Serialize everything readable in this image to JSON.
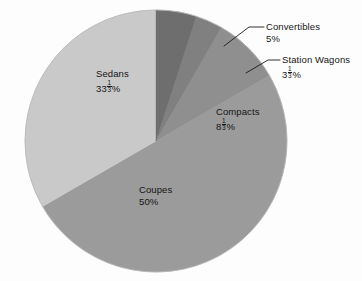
{
  "figure": {
    "background_color": "#fdfdfd",
    "width": 362,
    "height": 281
  },
  "chart_data": {
    "type": "pie",
    "title": "",
    "subtitle": "",
    "xlabel": "",
    "ylabel": "",
    "legend_position": "none",
    "grid": false,
    "label_style": "slice-labels-with-leader-lines",
    "start_angle_deg": 0,
    "direction": "clockwise",
    "center": {
      "x": 156,
      "y": 141
    },
    "radius": 131,
    "categories": [
      "Convertibles",
      "Station Wagons",
      "Compacts",
      "Coupes",
      "Sedans"
    ],
    "values": [
      5,
      3.3333,
      8.3333,
      50,
      33.3333
    ],
    "value_labels": [
      "5%",
      "3 1/3 %",
      "8 1/3 %",
      "50%",
      "33 1/3 %"
    ],
    "slices": [
      {
        "name": "Convertibles",
        "value": 5,
        "value_text": "5%",
        "value_whole": "5",
        "value_suffix": "%",
        "has_fraction": false,
        "fraction_num": "",
        "fraction_den": "",
        "color": "#6e6e6e",
        "label_placement": "outside",
        "start_angle_deg": 0,
        "end_angle_deg": 18
      },
      {
        "name": "Station Wagons",
        "value": 3.3333,
        "value_text": "3 1/3 %",
        "value_whole": "3",
        "value_suffix": "%",
        "has_fraction": true,
        "fraction_num": "1",
        "fraction_den": "3",
        "color": "#808080",
        "label_placement": "outside",
        "start_angle_deg": 18,
        "end_angle_deg": 30
      },
      {
        "name": "Compacts",
        "value": 8.3333,
        "value_text": "8 1/3 %",
        "value_whole": "8",
        "value_suffix": "%",
        "has_fraction": true,
        "fraction_num": "1",
        "fraction_den": "3",
        "color": "#8f8f8f",
        "label_placement": "inside",
        "start_angle_deg": 30,
        "end_angle_deg": 60
      },
      {
        "name": "Coupes",
        "value": 50,
        "value_text": "50%",
        "value_whole": "50",
        "value_suffix": "%",
        "has_fraction": false,
        "fraction_num": "",
        "fraction_den": "",
        "color": "#9b9b9b",
        "label_placement": "inside",
        "start_angle_deg": 90,
        "end_angle_deg": 270
      },
      {
        "name": "Sedans",
        "value": 33.3333,
        "value_text": "33 1/3 %",
        "value_whole": "33",
        "value_suffix": "%",
        "has_fraction": true,
        "fraction_num": "1",
        "fraction_den": "3",
        "color": "#c9c9c9",
        "label_placement": "inside",
        "start_angle_deg": 270,
        "end_angle_deg": 360
      }
    ],
    "leader_lines": [
      {
        "for": "Convertibles",
        "color": "#1a1a1a"
      },
      {
        "for": "Station Wagons",
        "color": "#1a1a1a"
      }
    ],
    "colors": {
      "convertibles": "#6e6e6e",
      "station_wagons": "#808080",
      "compacts": "#8f8f8f",
      "coupes": "#9b9b9b",
      "sedans": "#c9c9c9",
      "outline": "#b5b5b5",
      "text": "#161616"
    }
  }
}
